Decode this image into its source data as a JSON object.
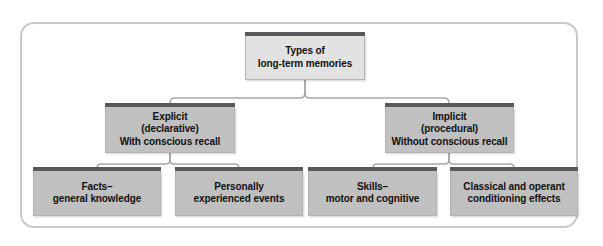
{
  "figure": {
    "title": "Types of long-term memories",
    "type": "hierarchy-tree-diagram",
    "levels": 3
  },
  "colors": {
    "frame_border": "#c9c9c9",
    "node_cap": "#59595b",
    "node_border": "#b3b3b3",
    "root_fill": "#e2e2e2",
    "branch_fill": "#c0c0c0",
    "leaf_fill": "#c0c0c0",
    "connector": "#a8a8a8",
    "text": "#111111",
    "background": "#ffffff"
  },
  "nodes": {
    "root": {
      "id": "types-of-long-term-memories",
      "lines": [
        "Types of",
        "long-term memories"
      ]
    },
    "explicit": {
      "id": "explicit-declarative",
      "lines": [
        "Explicit",
        "(declarative)",
        "With conscious recall"
      ]
    },
    "implicit": {
      "id": "implicit-procedural",
      "lines": [
        "Implicit",
        "(procedural)",
        "Without conscious recall"
      ]
    },
    "facts": {
      "id": "facts-general-knowledge",
      "lines": [
        "Facts–",
        "general knowledge"
      ]
    },
    "personally": {
      "id": "personally-experienced-events",
      "lines": [
        "Personally",
        "experienced events"
      ]
    },
    "skills": {
      "id": "skills-motor-and-cognitive",
      "lines": [
        "Skills–",
        "motor and cognitive"
      ]
    },
    "classical": {
      "id": "classical-and-operant-conditioning-effects",
      "lines": [
        "Classical and operant",
        "conditioning effects"
      ]
    }
  },
  "edges": [
    {
      "from": "root",
      "to": "explicit"
    },
    {
      "from": "root",
      "to": "implicit"
    },
    {
      "from": "explicit",
      "to": "facts"
    },
    {
      "from": "explicit",
      "to": "personally"
    },
    {
      "from": "implicit",
      "to": "skills"
    },
    {
      "from": "implicit",
      "to": "classical"
    }
  ]
}
